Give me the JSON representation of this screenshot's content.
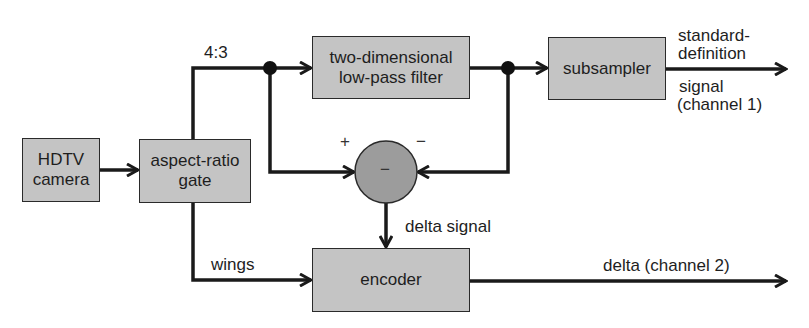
{
  "diagram": {
    "type": "block-diagram",
    "colors": {
      "box_fill": "#c4c4c4",
      "circle_fill": "#9c9c9c",
      "line": "#1a1a1a",
      "background": "#ffffff"
    },
    "blocks": {
      "camera": {
        "line1": "HDTV",
        "line2": "camera"
      },
      "gate": {
        "line1": "aspect-ratio",
        "line2": "gate"
      },
      "lpf": {
        "line1": "two-dimensional",
        "line2": "low-pass filter"
      },
      "subsampler": {
        "label": "subsampler"
      },
      "subtractor": {
        "symbol": "−",
        "plus": "+",
        "minus": "−"
      },
      "encoder": {
        "label": "encoder"
      }
    },
    "edge_labels": {
      "ratio": "4:3",
      "sd_line1": "standard-",
      "sd_line2": "definition",
      "sd_line3": "signal",
      "sd_line4": "(channel 1)",
      "delta_signal": "delta signal",
      "wings": "wings",
      "delta_out": "delta (channel 2)"
    },
    "edges": [
      {
        "from": "HDTV camera",
        "to": "aspect-ratio gate"
      },
      {
        "from": "aspect-ratio gate",
        "to": "two-dimensional low-pass filter",
        "label": "4:3"
      },
      {
        "from": "4:3 junction",
        "to": "subtractor (+)"
      },
      {
        "from": "two-dimensional low-pass filter",
        "to": "subsampler"
      },
      {
        "from": "filter output junction",
        "to": "subtractor (−)"
      },
      {
        "from": "subsampler",
        "to": "output",
        "label": "standard-definition signal (channel 1)"
      },
      {
        "from": "subtractor",
        "to": "encoder",
        "label": "delta signal"
      },
      {
        "from": "aspect-ratio gate",
        "to": "encoder",
        "label": "wings"
      },
      {
        "from": "encoder",
        "to": "output",
        "label": "delta (channel 2)"
      }
    ]
  }
}
